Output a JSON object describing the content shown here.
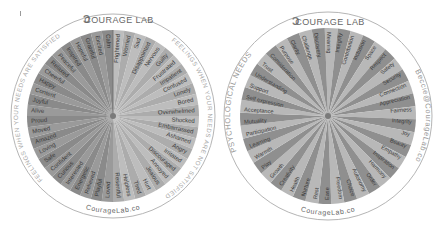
{
  "left_wheel": {
    "brand": "COURAGE LAB",
    "ring_top_right": "FEELINGS WHEN YOUR NEEDS ARE NOT SATISFIED",
    "ring_left": "FEELINGS WHEN YOUR NEEDS ARE SATISFIED",
    "ring_bottom": "CourageLab.co",
    "satisfied": [
      "Calm",
      "Excited",
      "Grateful",
      "Hopeful",
      "Inspired",
      "Peaceful",
      "Relaxed",
      "Cheerful",
      "Happy",
      "Content",
      "Joyful",
      "Alive",
      "Proud",
      "Moved",
      "Amazed",
      "Loving",
      "Safe",
      "Confident",
      "Curious",
      "Interested",
      "Energetic",
      "Relieved",
      "Playful",
      "Loved"
    ],
    "not_satisfied": [
      "Frightened",
      "Worried",
      "Sad",
      "Disappointed",
      "Nervous",
      "Guilty",
      "Frustrated",
      "Impatient",
      "Confused",
      "Lonely",
      "Bored",
      "Overwhelmed",
      "Shocked",
      "Embarrassed",
      "Ashamed",
      "Angry",
      "Irritated",
      "Discouraged",
      "Annoyed",
      "Jealous",
      "Hurt",
      "Tired",
      "Helpless",
      "Resentful"
    ],
    "colors": {
      "satisfied_light": "#9a9a9a",
      "satisfied_dark": "#8a8a8a",
      "unsat_light": "#bdbdbd",
      "unsat_dark": "#acacac",
      "ring": "#b5b5b5",
      "text": "#3a3a3a"
    }
  },
  "right_wheel": {
    "brand": "COURAGE LAB",
    "ring_left": "PSYCHOLOGICAL NEEDS",
    "ring_right": "Beccie@CourageLab.co",
    "ring_bottom": "CourageLab.co",
    "needs": [
      "Meaning",
      "Integrity",
      "Contribution",
      "Inclusion",
      "Space",
      "Respect",
      "Safety",
      "Security",
      "Connection",
      "Appreciation",
      "Fairness",
      "Integrity",
      "Joy",
      "Beauty",
      "Empathy",
      "Inspiration",
      "Harmony",
      "Order",
      "Autonomy",
      "Choice",
      "Freedom",
      "Ease",
      "Rest",
      "Nurture",
      "Health",
      "Creativity",
      "Growth",
      "Play",
      "Warmth",
      "Learning",
      "Participation",
      "Mutuality",
      "Acceptance",
      "Self expression",
      "Support",
      "Understanding",
      "Trust",
      "Consideration",
      "Purpose",
      "Clarity",
      "Challenge",
      "Discovery"
    ],
    "colors": {
      "wedge_light": "#b8b8b8",
      "wedge_dark": "#8f8f8f",
      "ring": "#b5b5b5",
      "text": "#3a3a3a"
    }
  }
}
